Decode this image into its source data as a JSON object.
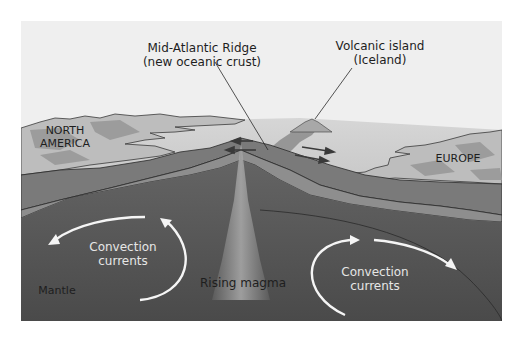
{
  "diagram": {
    "callouts": {
      "ridge": {
        "line1": "Mid-Atlantic Ridge",
        "line2": "(new oceanic crust)"
      },
      "island": {
        "line1": "Volcanic island",
        "line2": "(Iceland)"
      }
    },
    "continents": {
      "west": {
        "line1": "NORTH",
        "line2": "AMERICA"
      },
      "east": {
        "line1": "EUROPE"
      }
    },
    "mantle": {
      "label": "Mantle",
      "magma_label": "Rising magma",
      "convection_left": {
        "line1": "Convection",
        "line2": "currents"
      },
      "convection_right": {
        "line1": "Convection",
        "line2": "currents"
      }
    },
    "colors": {
      "sky": "#efefef",
      "ocean_surface": "#cfcfcf",
      "land_light": "#bdbdbd",
      "land_shade": "#9a9a9a",
      "crust": "#7a7a7a",
      "lithosphere": "#8c8c8c",
      "mantle": "#5a5a5a",
      "mantle_deep": "#4a4a4a",
      "magma": "#8a8a8a",
      "arrow_white": "#f5f5f5",
      "arrow_dark": "#3a3a3a"
    }
  }
}
